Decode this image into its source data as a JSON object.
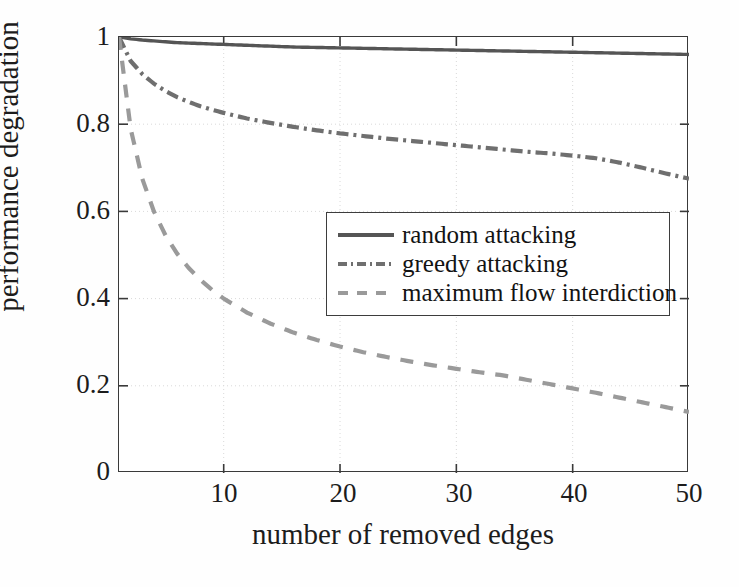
{
  "chart_data": {
    "type": "line",
    "title": "",
    "xlabel": "number of removed edges",
    "ylabel": "performance degradation",
    "xlim": [
      1,
      50
    ],
    "ylim": [
      0,
      1
    ],
    "xticks": [
      10,
      20,
      30,
      40,
      50
    ],
    "xticklabels": [
      "10",
      "20",
      "30",
      "40",
      "50"
    ],
    "yticks": [
      0,
      0.2,
      0.4,
      0.6,
      0.8,
      1
    ],
    "yticklabels": [
      "0",
      "0.2",
      "0.4",
      "0.6",
      "0.8",
      "1"
    ],
    "grid": "dotted-faint",
    "legend_position": "center-right",
    "x": [
      1,
      2,
      3,
      4,
      5,
      6,
      7,
      8,
      9,
      10,
      12,
      14,
      16,
      18,
      20,
      22,
      24,
      26,
      28,
      30,
      32,
      34,
      36,
      38,
      40,
      42,
      44,
      46,
      48,
      50
    ],
    "series": [
      {
        "name": "random attacking",
        "style": "solid",
        "color": "#555555",
        "values": [
          1.0,
          0.996,
          0.993,
          0.991,
          0.989,
          0.987,
          0.986,
          0.985,
          0.984,
          0.983,
          0.981,
          0.979,
          0.977,
          0.976,
          0.975,
          0.974,
          0.973,
          0.972,
          0.971,
          0.97,
          0.969,
          0.968,
          0.967,
          0.966,
          0.965,
          0.964,
          0.963,
          0.962,
          0.961,
          0.96
        ]
      },
      {
        "name": "greedy attacking",
        "style": "dash-dot",
        "color": "#6f6f6f",
        "values": [
          1.0,
          0.945,
          0.915,
          0.893,
          0.876,
          0.862,
          0.851,
          0.841,
          0.833,
          0.826,
          0.813,
          0.803,
          0.794,
          0.786,
          0.779,
          0.773,
          0.767,
          0.762,
          0.757,
          0.752,
          0.747,
          0.742,
          0.737,
          0.733,
          0.728,
          0.722,
          0.712,
          0.7,
          0.687,
          0.675
        ]
      },
      {
        "name": "maximum flow interdiction",
        "style": "dashed",
        "color": "#9a9a9a",
        "values": [
          1.0,
          0.79,
          0.675,
          0.6,
          0.545,
          0.503,
          0.47,
          0.443,
          0.42,
          0.4,
          0.368,
          0.343,
          0.322,
          0.305,
          0.29,
          0.277,
          0.266,
          0.256,
          0.247,
          0.239,
          0.231,
          0.224,
          0.214,
          0.204,
          0.194,
          0.184,
          0.173,
          0.162,
          0.151,
          0.14
        ]
      }
    ]
  },
  "legend": {
    "items": [
      {
        "label": "random attacking"
      },
      {
        "label": "greedy attacking"
      },
      {
        "label": "maximum flow interdiction"
      }
    ]
  }
}
